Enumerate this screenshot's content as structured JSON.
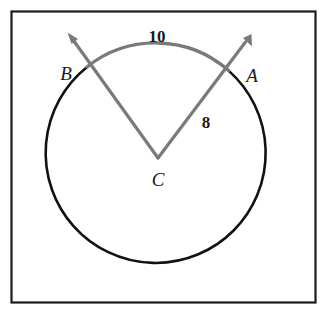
{
  "figure": {
    "frame": {
      "stroke_color": "#1c1c1c",
      "fill_color": "#ffffff"
    },
    "circle": {
      "name": "circle",
      "center_label": "C",
      "stroke_color": "#111111",
      "cx": 162,
      "cy": 158,
      "r": 110
    },
    "arc": {
      "name": "arc-AB",
      "label": "10",
      "stroke_color": "#7a7a7a",
      "from_point": "B",
      "to_point": "A"
    },
    "radius": {
      "name": "radius-CA",
      "label": "8",
      "stroke_color": "#7a7a7a"
    },
    "points": [
      {
        "id": "B",
        "label": "B",
        "x": 66,
        "y": 73
      },
      {
        "id": "A",
        "label": "A",
        "x": 252,
        "y": 75
      },
      {
        "id": "C",
        "label": "C",
        "x": 158,
        "y": 179
      }
    ],
    "measures": [
      {
        "id": "arc-length",
        "label": "10",
        "x": 157,
        "y": 36
      },
      {
        "id": "radius-length",
        "label": "8",
        "x": 206,
        "y": 122
      }
    ],
    "rays": [
      {
        "id": "ray-CB",
        "from": "C",
        "through": "B",
        "arrow": true
      },
      {
        "id": "ray-CA",
        "from": "C",
        "through": "A",
        "arrow": true
      }
    ]
  }
}
